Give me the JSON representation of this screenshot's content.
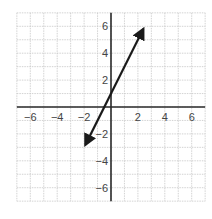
{
  "chart_data": {
    "type": "line",
    "title": "",
    "xlabel": "",
    "ylabel": "",
    "xlim": [
      -7,
      7
    ],
    "ylim": [
      -7,
      7
    ],
    "grid": true,
    "x_ticks": [
      -6,
      -4,
      -2,
      2,
      4,
      6
    ],
    "y_ticks": [
      6,
      4,
      2,
      -2,
      -4,
      -6
    ],
    "x_tick_labels": [
      "−6",
      "−4",
      "−2",
      "2",
      "4",
      "6"
    ],
    "y_tick_labels": [
      "6",
      "4",
      "2",
      "−2",
      "−4",
      "−6"
    ],
    "series": [
      {
        "name": "y = 2x + 1",
        "equation": "y = 2x + 1",
        "slope": 2,
        "intercept": 1,
        "x": [
          -1.9,
          2.4
        ],
        "y": [
          -2.8,
          5.8
        ],
        "arrows": "both",
        "color": "#1a1a1a"
      }
    ],
    "legend": null
  },
  "colors": {
    "grid": "#c8c8c8",
    "axis": "#2a2a2a",
    "line": "#1a1a1a",
    "label": "#444444"
  }
}
